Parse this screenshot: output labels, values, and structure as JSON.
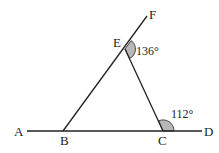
{
  "diagram": {
    "type": "geometry-figure",
    "points": {
      "A": {
        "label": "A",
        "x": 27,
        "y": 131
      },
      "B": {
        "label": "B",
        "x": 63,
        "y": 131
      },
      "C": {
        "label": "C",
        "x": 163,
        "y": 131
      },
      "D": {
        "label": "D",
        "x": 202,
        "y": 131
      },
      "E": {
        "label": "E",
        "x": 125,
        "y": 49
      },
      "F": {
        "label": "F",
        "x": 147,
        "y": 16
      }
    },
    "segments": [
      {
        "from": "A",
        "to": "D"
      },
      {
        "from": "B",
        "to": "F"
      },
      {
        "from": "E",
        "to": "C"
      }
    ],
    "angles": [
      {
        "vertex": "E",
        "label": "136°",
        "between": [
          "F",
          "C"
        ]
      },
      {
        "vertex": "C",
        "label": "112°",
        "between": [
          "E",
          "D"
        ]
      }
    ],
    "colors": {
      "line": "#222222",
      "angle_fill": "#b8b8b8"
    }
  }
}
